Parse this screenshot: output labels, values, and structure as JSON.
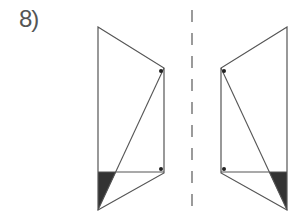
{
  "problem": {
    "number_label": "8)"
  },
  "colors": {
    "stroke": "#555555",
    "shade": "#333333",
    "dot": "#222222",
    "axis": "#666666"
  },
  "figure": {
    "mirror_line": {
      "x": 192,
      "y1": 10,
      "y2": 213,
      "dash": 12,
      "gap": 11
    },
    "left_shape": {
      "vertices": [
        [
          98,
          27
        ],
        [
          164,
          68
        ],
        [
          164,
          173
        ],
        [
          98,
          210
        ]
      ],
      "diagonal": [
        [
          164,
          68
        ],
        [
          98,
          210
        ]
      ],
      "horizontal": [
        [
          98,
          172
        ],
        [
          164,
          172
        ]
      ],
      "shaded_triangle": [
        [
          98,
          172
        ],
        [
          116,
          172
        ],
        [
          98,
          210
        ]
      ],
      "dots": [
        [
          161,
          71
        ],
        [
          161,
          169
        ]
      ]
    },
    "right_shape": {
      "vertices": [
        [
          287,
          27
        ],
        [
          221,
          68
        ],
        [
          221,
          173
        ],
        [
          287,
          210
        ]
      ],
      "diagonal": [
        [
          221,
          68
        ],
        [
          287,
          210
        ]
      ],
      "horizontal": [
        [
          221,
          172
        ],
        [
          287,
          172
        ]
      ],
      "shaded_triangle": [
        [
          287,
          172
        ],
        [
          269,
          172
        ],
        [
          287,
          210
        ]
      ],
      "dots": [
        [
          224,
          71
        ],
        [
          224,
          169
        ]
      ]
    }
  }
}
